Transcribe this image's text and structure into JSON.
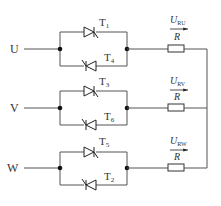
{
  "diagram": {
    "type": "three-phase AC voltage controller (anti-parallel thyristors, resistive load)",
    "phases": [
      {
        "name": "U",
        "top_thyristor": "T",
        "top_sub": "1",
        "bottom_thyristor": "T",
        "bottom_sub": "4",
        "voltage": "U",
        "voltage_sub": "RU",
        "resistor": "R"
      },
      {
        "name": "V",
        "top_thyristor": "T",
        "top_sub": "3",
        "bottom_thyristor": "T",
        "bottom_sub": "6",
        "voltage": "U",
        "voltage_sub": "RV",
        "resistor": "R"
      },
      {
        "name": "W",
        "top_thyristor": "T",
        "top_sub": "5",
        "bottom_thyristor": "T",
        "bottom_sub": "2",
        "voltage": "U",
        "voltage_sub": "RW",
        "resistor": "R"
      }
    ],
    "colors": {
      "wire": "#555555",
      "node": "#111111",
      "text": "#333333"
    }
  }
}
